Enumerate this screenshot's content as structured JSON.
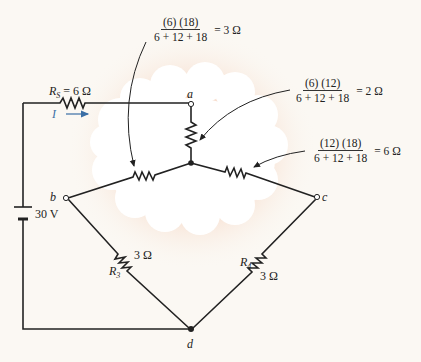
{
  "figure": {
    "source": {
      "label": "R_S = 6 Ω",
      "symbol": "R",
      "sub": "S",
      "value": "= 6 Ω"
    },
    "current": {
      "label": "I",
      "color": "#3a6ea5"
    },
    "battery": {
      "label": "30 V"
    },
    "nodes": {
      "a": "a",
      "b": "b",
      "c": "c",
      "d": "d"
    },
    "r3": {
      "symbol": "R",
      "sub": "3",
      "value": "3 Ω"
    },
    "r4": {
      "symbol": "R",
      "sub": "4",
      "value": "3 Ω"
    },
    "annotations": [
      {
        "numerator": "(6) (18)",
        "denominator": "6 + 12 + 18",
        "result": "= 3 Ω"
      },
      {
        "numerator": "(6) (12)",
        "denominator": "6 + 12 + 18",
        "result": "= 2 Ω"
      },
      {
        "numerator": "(12) (18)",
        "denominator": "6 + 12 + 18",
        "result": "= 6 Ω"
      }
    ],
    "colors": {
      "wire": "#222222",
      "glow": "#f2c9b0",
      "cloud": "#ffffff",
      "background": "#fbf8f3"
    }
  }
}
